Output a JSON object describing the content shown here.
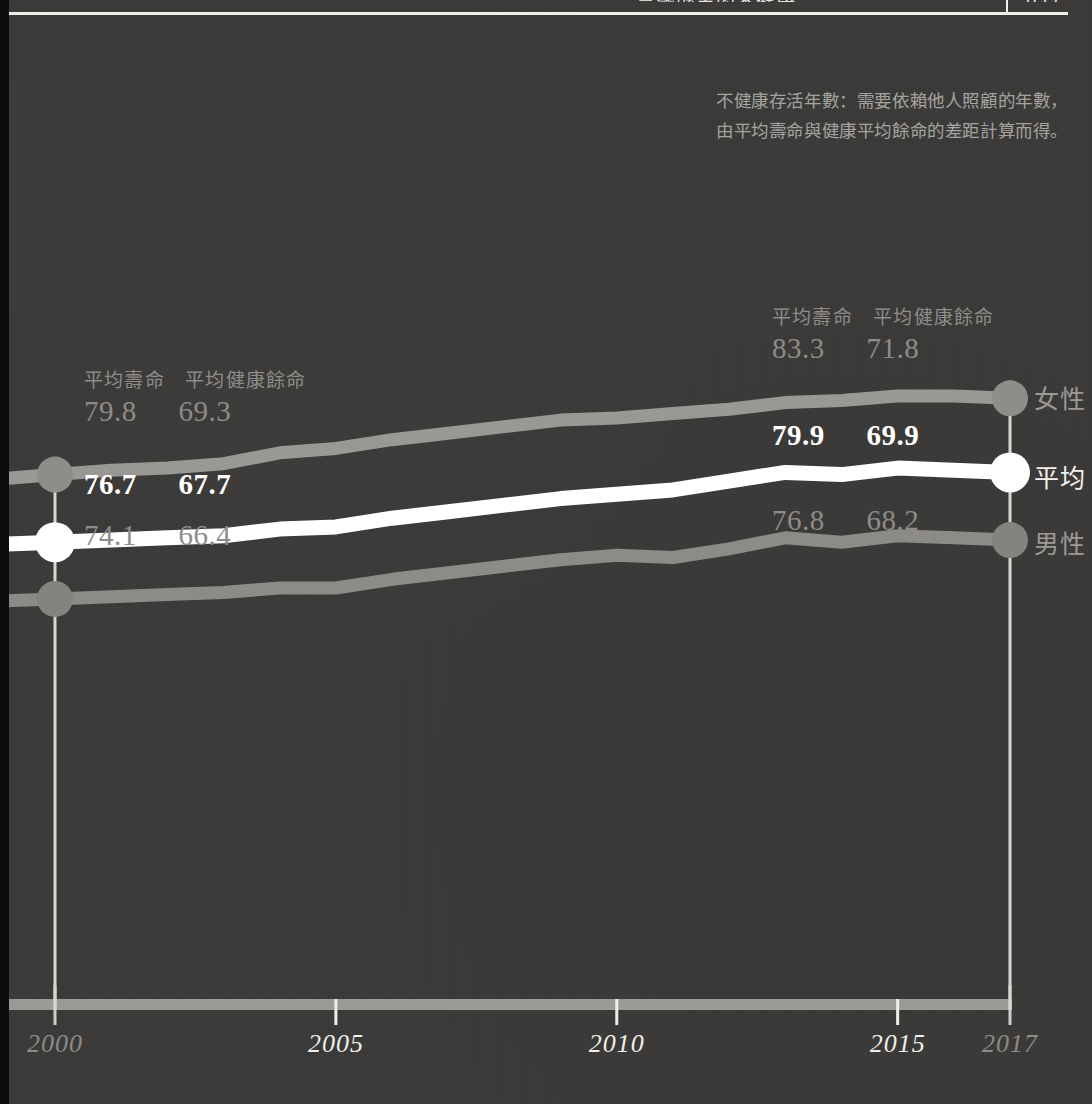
{
  "page": {
    "background_color": "#3b3a38",
    "accent_white": "#ffffff",
    "dim_gray": "#8e8c89",
    "line_gray": "#9a9895"
  },
  "top_bar": {
    "clipped_title": "臺灣縣市的不健康",
    "clipped_number": "099"
  },
  "annotation": {
    "line1": "不健康存活年數：需要依賴他人照顧的年數，",
    "line2": "由平均壽命與健康平均餘命的差距計算而得。"
  },
  "value_labels": {
    "header_life_expectancy": "平均壽命",
    "header_healthy_life_expectancy": "平均健康餘命",
    "female_2000": {
      "life": "79.8",
      "healthy": "69.3"
    },
    "average_2000": {
      "life": "76.7",
      "healthy": "67.7"
    },
    "male_2000": {
      "life": "74.1",
      "healthy": "66.4"
    },
    "female_2017": {
      "life": "83.3",
      "healthy": "71.8"
    },
    "average_2017": {
      "life": "79.9",
      "healthy": "69.9"
    },
    "male_2017": {
      "life": "76.8",
      "healthy": "68.2"
    }
  },
  "series_names": {
    "female": "女性",
    "average": "平均",
    "male": "男性"
  },
  "chart_data": {
    "type": "line",
    "title": "",
    "xlabel": "",
    "ylabel": "",
    "grid": false,
    "legend_position": "right-inline",
    "x": [
      2000,
      2001,
      2002,
      2003,
      2004,
      2005,
      2006,
      2007,
      2008,
      2009,
      2010,
      2011,
      2012,
      2013,
      2014,
      2015,
      2016,
      2017
    ],
    "xlim": [
      2000,
      2017
    ],
    "xticks": [
      2000,
      2005,
      2010,
      2015,
      2017
    ],
    "xtick_labels": [
      "2000",
      "2005",
      "2010",
      "2015",
      "2017"
    ],
    "xtick_styles": [
      "dim",
      "bright",
      "bright",
      "bright",
      "dim"
    ],
    "ylim": [
      73.5,
      84.0
    ],
    "series": [
      {
        "name": "女性",
        "color": "#9a9895",
        "marker_color": "#8f8d8a",
        "values": [
          79.8,
          80.0,
          80.1,
          80.3,
          80.8,
          81.0,
          81.4,
          81.7,
          82.0,
          82.3,
          82.4,
          82.6,
          82.8,
          83.1,
          83.2,
          83.4,
          83.4,
          83.3
        ]
      },
      {
        "name": "平均",
        "color": "#ffffff",
        "marker_color": "#ffffff",
        "values": [
          76.7,
          76.8,
          76.9,
          77.0,
          77.3,
          77.4,
          77.8,
          78.1,
          78.4,
          78.7,
          78.9,
          79.1,
          79.5,
          79.9,
          79.8,
          80.1,
          80.0,
          79.9
        ]
      },
      {
        "name": "男性",
        "color": "#8d8b88",
        "marker_color": "#85837f",
        "values": [
          74.1,
          74.2,
          74.3,
          74.4,
          74.6,
          74.6,
          75.0,
          75.3,
          75.6,
          75.9,
          76.1,
          76.0,
          76.4,
          76.9,
          76.7,
          77.0,
          76.9,
          76.8
        ]
      }
    ],
    "endpoint_markers": [
      2000,
      2017
    ],
    "axis_bar_color": "#9c9a97"
  }
}
